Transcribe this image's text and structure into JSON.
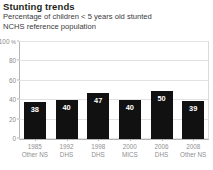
{
  "header": {
    "title": "Stunting trends",
    "subtitle_line1": "Percentage of children < 5 years old stunted",
    "subtitle_line2": "NCHS reference population"
  },
  "chart_data": {
    "type": "bar",
    "title": "Stunting trends",
    "subtitle": "Percentage of children < 5 years old stunted NCHS reference population",
    "categories": [
      "1985",
      "1992",
      "1998",
      "2000",
      "2006",
      "2008"
    ],
    "sources": [
      "Other NS",
      "DHS",
      "DHS",
      "MICS",
      "DHS",
      "Other NS"
    ],
    "values": [
      38,
      40,
      47,
      40,
      50,
      39
    ],
    "value_labels": [
      "38",
      "40",
      "47",
      "40",
      "50",
      "39"
    ],
    "xlabel": "",
    "ylabel": "",
    "yunit": "%",
    "ylim": [
      0,
      100
    ],
    "yticks": [
      0,
      20,
      40,
      60,
      80,
      100
    ],
    "ytick_labels": [
      "0",
      "20",
      "40",
      "60",
      "80",
      "100"
    ],
    "grid": true,
    "legend": false,
    "bar_color": "#111111",
    "grid_color": "#e2e2e2",
    "axis_color": "#b5b5b5",
    "tick_label_color": "#8f8f8f"
  }
}
